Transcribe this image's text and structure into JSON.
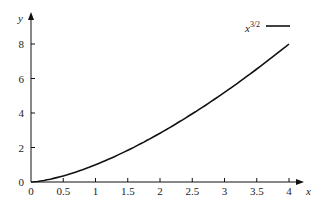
{
  "chart_data": {
    "type": "line",
    "title": "",
    "xlabel": "x",
    "ylabel": "y",
    "xlim": [
      0,
      4
    ],
    "ylim": [
      0,
      8
    ],
    "x_ticks": [
      "0",
      "0.5",
      "1",
      "1.5",
      "2",
      "2.5",
      "3",
      "3.5",
      "4"
    ],
    "y_ticks": [
      "0",
      "2",
      "4",
      "6",
      "8"
    ],
    "grid": false,
    "legend_position": "upper right",
    "series": [
      {
        "name": "x^{3/2}",
        "color": "#111111",
        "x": [
          0,
          0.25,
          0.5,
          0.75,
          1,
          1.25,
          1.5,
          1.75,
          2,
          2.25,
          2.5,
          2.75,
          3,
          3.25,
          3.5,
          3.75,
          4
        ],
        "values": [
          0,
          0.125,
          0.354,
          0.65,
          1,
          1.398,
          1.837,
          2.315,
          2.828,
          3.375,
          3.953,
          4.56,
          5.196,
          5.859,
          6.548,
          7.262,
          8
        ]
      }
    ]
  },
  "legend": {
    "base": "x",
    "exponent": "3/2"
  },
  "axes": {
    "x_label": "x",
    "y_label": "y"
  }
}
